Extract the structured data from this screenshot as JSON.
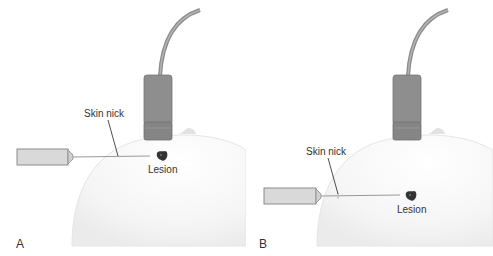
{
  "figure": {
    "panels": [
      {
        "id": "A",
        "letter": "A",
        "skin_nick_label": "Skin nick",
        "lesion_label": "Lesion",
        "description": "Needle inserted horizontally near the top of the breast, skin nick close to transducer"
      },
      {
        "id": "B",
        "letter": "B",
        "skin_nick_label": "Skin nick",
        "lesion_label": "Lesion",
        "description": "Needle inserted horizontally lower on the breast, skin nick further from transducer"
      }
    ],
    "colors": {
      "breast_fill": "#f4f4f4",
      "transducer": "#8e8e8e",
      "transducer_dark": "#7a7a7a",
      "cable": "#8a8a8a",
      "syringe_fill": "#d9d9d9",
      "syringe_stroke": "#8c8c8c",
      "needle": "#9a9a9a",
      "lesion": "#333333",
      "leader_line": "#222222",
      "text": "#333333"
    }
  }
}
